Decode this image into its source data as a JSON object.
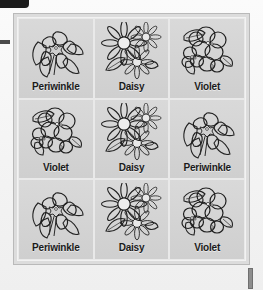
{
  "panel": {
    "border_color": "#b9b9b9",
    "background_color": "#d2d2d2",
    "inner_border_color": "#f2f2f2"
  },
  "marks": {
    "top_left_label": "top-left-black-tab",
    "left_dash_label": "left-edge-dash",
    "bottom_right_label": "bottom-right-scroll-mark"
  },
  "grid": {
    "columns": 3,
    "rows": 3,
    "cells": [
      {
        "label": "Periwinkle",
        "art": "periwinkle"
      },
      {
        "label": "Daisy",
        "art": "daisy"
      },
      {
        "label": "Violet",
        "art": "violet"
      },
      {
        "label": "Violet",
        "art": "violet"
      },
      {
        "label": "Daisy",
        "art": "daisy"
      },
      {
        "label": "Periwinkle",
        "art": "periwinkle"
      },
      {
        "label": "Periwinkle",
        "art": "periwinkle"
      },
      {
        "label": "Daisy",
        "art": "daisy"
      },
      {
        "label": "Violet",
        "art": "violet"
      }
    ]
  },
  "colors": {
    "ink": "#1a1a1a",
    "cell_background": "#d4d4d4",
    "page_background": "#f4f4f4",
    "mark_dark": "#1c1c1c"
  }
}
